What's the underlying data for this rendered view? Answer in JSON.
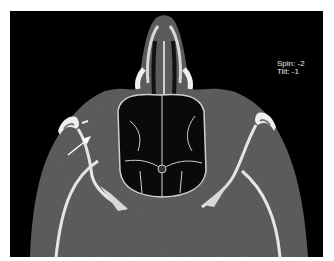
{
  "image": {
    "type": "axial CT scan, bone window",
    "background": "#000000",
    "soft_tissue_color": "#555555",
    "bone_color": "#e6e6e6",
    "air_color": "#050505"
  },
  "overlay": {
    "spin_label": "Spin:",
    "spin_value": "-2",
    "tilt_label": "Tilt:",
    "tilt_value": "-1",
    "text_color": "#e8e8e8"
  },
  "annotation": {
    "arrow_icon": "arrow-up-right",
    "arrow_color": "#ffffff"
  }
}
